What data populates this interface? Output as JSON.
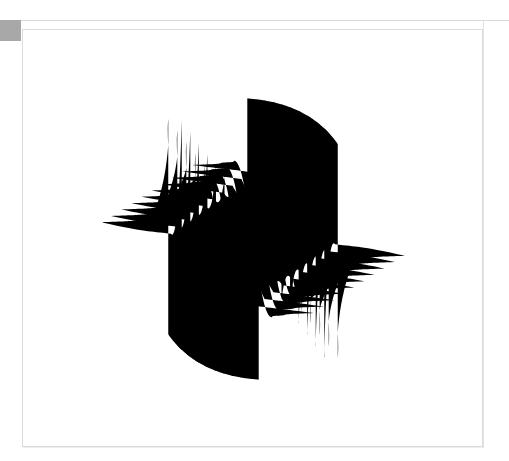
{
  "document": {
    "title": "Op Art Wave Composition",
    "background_color": "#ffffff"
  },
  "corner_marker": {
    "name": "corner-marker",
    "color": "#a8a8a8",
    "x": 0,
    "y": 20,
    "width": 21,
    "height": 21
  },
  "frame": {
    "name": "canvas-frame",
    "border_color": "#dcdcdc",
    "fill_color": "#ffffff",
    "x": 22,
    "y": 29,
    "width": 461,
    "height": 418
  },
  "rules": {
    "top_rule_color": "#d9d9d9",
    "right_rule_color": "#e2e2e2"
  },
  "artwork": {
    "name": "op-art-striped-wave",
    "style": "op-art",
    "description": "Black and white striped S-curve wave form with 180 degree rotational symmetry",
    "stripe_color": "#000000",
    "ground_color": "#ffffff",
    "stripe_count": 10,
    "viewbox": "0 0 461 418",
    "center": {
      "x": 230,
      "y": 209
    },
    "bounds": {
      "left": 78,
      "top": 68,
      "right": 392,
      "bottom": 350
    },
    "stripes": [
      {
        "index": 0,
        "offset": 0,
        "thickness_vert": 13.5,
        "thickness_horz": 9.5
      },
      {
        "index": 1,
        "offset": 22,
        "thickness_vert": 13.0,
        "thickness_horz": 9.0
      },
      {
        "index": 2,
        "offset": 44,
        "thickness_vert": 12.5,
        "thickness_horz": 8.5
      },
      {
        "index": 3,
        "offset": 66,
        "thickness_vert": 12.0,
        "thickness_horz": 8.0
      },
      {
        "index": 4,
        "offset": 88,
        "thickness_vert": 11.5,
        "thickness_horz": 7.5
      },
      {
        "index": 5,
        "offset": 110,
        "thickness_vert": 11.0,
        "thickness_horz": 7.0
      },
      {
        "index": 6,
        "offset": 132,
        "thickness_vert": 10.5,
        "thickness_horz": 6.5
      },
      {
        "index": 7,
        "offset": 154,
        "thickness_vert": 10.0,
        "thickness_horz": 6.0
      },
      {
        "index": 8,
        "offset": 176,
        "thickness_vert": 9.5,
        "thickness_horz": 5.5
      },
      {
        "index": 9,
        "offset": 198,
        "thickness_vert": 9.0,
        "thickness_horz": 5.0
      }
    ]
  }
}
